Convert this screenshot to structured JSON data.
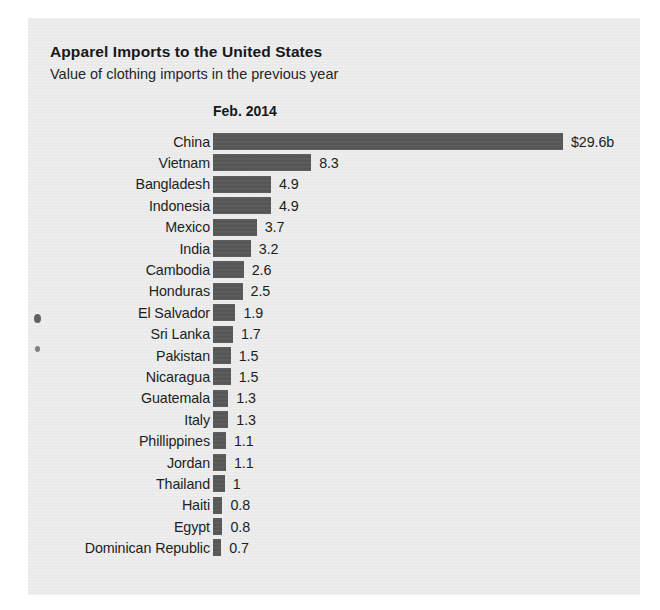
{
  "chart_data": {
    "type": "bar",
    "orientation": "horizontal",
    "title": "Apparel Imports to the United States",
    "subtitle": "Value of clothing imports in the previous year",
    "column_header": "Feb. 2014",
    "xlabel": "",
    "ylabel": "",
    "unit": "billions of U.S. dollars",
    "grid": false,
    "legend": null,
    "xlim": [
      0,
      29.6
    ],
    "bar_color": "#585858",
    "background_color": "#ededed",
    "categories": [
      "China",
      "Vietnam",
      "Bangladesh",
      "Indonesia",
      "Mexico",
      "India",
      "Cambodia",
      "Honduras",
      "El Salvador",
      "Sri Lanka",
      "Pakistan",
      "Nicaragua",
      "Guatemala",
      "Italy",
      "Phillippines",
      "Jordan",
      "Thailand",
      "Haiti",
      "Egypt",
      "Dominican Republic"
    ],
    "values": [
      29.6,
      8.3,
      4.9,
      4.9,
      3.7,
      3.2,
      2.6,
      2.5,
      1.9,
      1.7,
      1.5,
      1.5,
      1.3,
      1.3,
      1.1,
      1.1,
      1,
      0.8,
      0.8,
      0.7
    ],
    "value_labels": [
      "$29.6b",
      "8.3",
      "4.9",
      "4.9",
      "3.7",
      "3.2",
      "2.6",
      "2.5",
      "1.9",
      "1.7",
      "1.5",
      "1.5",
      "1.3",
      "1.3",
      "1.1",
      "1.1",
      "1",
      "0.8",
      "0.8",
      "0.7"
    ]
  }
}
